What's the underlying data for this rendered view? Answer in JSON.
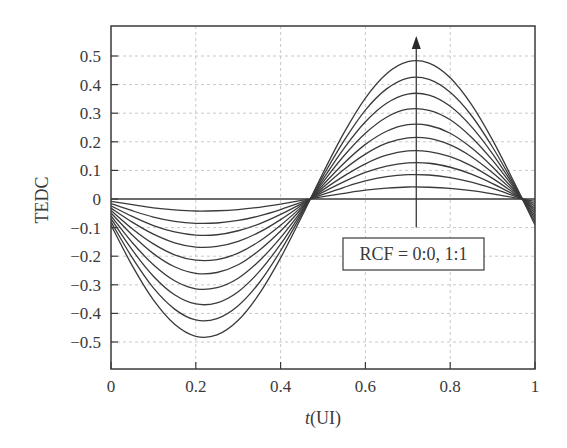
{
  "chart_data": {
    "type": "line",
    "title": "",
    "xlabel_italic": "t",
    "xlabel_rest": "(UI)",
    "xlabel": "t(UI)",
    "ylabel": "TEDC",
    "xlim": [
      0,
      1
    ],
    "ylim": [
      -0.6,
      0.6
    ],
    "grid": true,
    "legend": "none",
    "xticks": [
      0,
      0.2,
      0.4,
      0.6,
      0.8,
      1
    ],
    "xtick_labels": [
      "0",
      "0.2",
      "0.4",
      "0.6",
      "0.8",
      "1"
    ],
    "yticks": [
      0.5,
      0.4,
      0.3,
      0.2,
      0.1,
      0,
      -0.1,
      -0.2,
      -0.3,
      -0.4,
      -0.5
    ],
    "ytick_labels": [
      "0.5",
      "0.4",
      "0.3",
      "0.2",
      "0.1",
      "0",
      "-0.1",
      "-0.2",
      "-0.3",
      "-0.4",
      "-0.5"
    ],
    "annotations": [
      {
        "type": "box",
        "text": "RCF = 0:0, 1:1",
        "x": 0.72,
        "y": -0.16
      },
      {
        "type": "arrow",
        "x": 0.72,
        "y_from": -0.1,
        "y_to": 0.57,
        "direction": "increasing RCF"
      }
    ],
    "line_color": "#3a3a3a",
    "x": [
      0,
      0.05,
      0.1,
      0.15,
      0.2,
      0.25,
      0.3,
      0.35,
      0.4,
      0.45,
      0.5,
      0.55,
      0.6,
      0.65,
      0.7,
      0.75,
      0.8,
      0.85,
      0.9,
      0.95,
      1.0
    ],
    "series": [
      {
        "name": "curve-0",
        "values": [
          0,
          0,
          0,
          0,
          0,
          0,
          0,
          0,
          0,
          0,
          0,
          0,
          0,
          0,
          0,
          0,
          0,
          0,
          0,
          0,
          0
        ]
      },
      {
        "name": "curve-1",
        "values": [
          -0.008,
          -0.02,
          -0.031,
          -0.038,
          -0.042,
          -0.041,
          -0.037,
          -0.029,
          -0.018,
          -0.005,
          0.008,
          0.02,
          0.031,
          0.038,
          0.042,
          0.041,
          0.037,
          0.029,
          0.018,
          0.005,
          -0.008
        ]
      },
      {
        "name": "curve-2",
        "values": [
          -0.016,
          -0.041,
          -0.063,
          -0.078,
          -0.085,
          -0.084,
          -0.075,
          -0.059,
          -0.037,
          -0.011,
          0.016,
          0.041,
          0.063,
          0.078,
          0.085,
          0.084,
          0.075,
          0.059,
          0.037,
          0.011,
          -0.016
        ]
      },
      {
        "name": "curve-3",
        "values": [
          -0.024,
          -0.061,
          -0.093,
          -0.115,
          -0.126,
          -0.125,
          -0.111,
          -0.087,
          -0.054,
          -0.016,
          0.024,
          0.061,
          0.093,
          0.115,
          0.126,
          0.125,
          0.111,
          0.087,
          0.054,
          0.016,
          -0.024
        ]
      },
      {
        "name": "curve-4",
        "values": [
          -0.032,
          -0.081,
          -0.123,
          -0.153,
          -0.168,
          -0.166,
          -0.148,
          -0.116,
          -0.072,
          -0.021,
          0.032,
          0.081,
          0.123,
          0.153,
          0.168,
          0.166,
          0.148,
          0.116,
          0.072,
          0.021,
          -0.032
        ]
      },
      {
        "name": "curve-5",
        "values": [
          -0.04,
          -0.104,
          -0.157,
          -0.195,
          -0.214,
          -0.212,
          -0.189,
          -0.148,
          -0.092,
          -0.027,
          0.04,
          0.104,
          0.157,
          0.195,
          0.214,
          0.212,
          0.189,
          0.148,
          0.092,
          0.027,
          -0.04
        ]
      },
      {
        "name": "curve-6",
        "values": [
          -0.049,
          -0.126,
          -0.191,
          -0.237,
          -0.26,
          -0.257,
          -0.23,
          -0.179,
          -0.112,
          -0.033,
          0.049,
          0.126,
          0.191,
          0.237,
          0.26,
          0.257,
          0.23,
          0.179,
          0.112,
          0.033,
          -0.049
        ]
      },
      {
        "name": "curve-7",
        "values": [
          -0.059,
          -0.152,
          -0.23,
          -0.286,
          -0.314,
          -0.31,
          -0.277,
          -0.216,
          -0.135,
          -0.04,
          0.059,
          0.152,
          0.23,
          0.286,
          0.314,
          0.31,
          0.277,
          0.216,
          0.135,
          0.04,
          -0.059
        ]
      },
      {
        "name": "curve-8",
        "values": [
          -0.069,
          -0.178,
          -0.27,
          -0.335,
          -0.367,
          -0.363,
          -0.324,
          -0.253,
          -0.158,
          -0.046,
          0.069,
          0.178,
          0.27,
          0.335,
          0.367,
          0.363,
          0.324,
          0.253,
          0.158,
          0.046,
          -0.069
        ]
      },
      {
        "name": "curve-9",
        "values": [
          -0.08,
          -0.205,
          -0.311,
          -0.385,
          -0.423,
          -0.418,
          -0.373,
          -0.292,
          -0.181,
          -0.053,
          0.08,
          0.205,
          0.311,
          0.385,
          0.423,
          0.418,
          0.373,
          0.292,
          0.181,
          0.053,
          -0.08
        ]
      },
      {
        "name": "curve-10",
        "values": [
          -0.091,
          -0.233,
          -0.353,
          -0.438,
          -0.48,
          -0.475,
          -0.424,
          -0.331,
          -0.206,
          -0.061,
          0.091,
          0.233,
          0.353,
          0.438,
          0.48,
          0.475,
          0.424,
          0.331,
          0.206,
          0.061,
          -0.091
        ]
      }
    ]
  }
}
